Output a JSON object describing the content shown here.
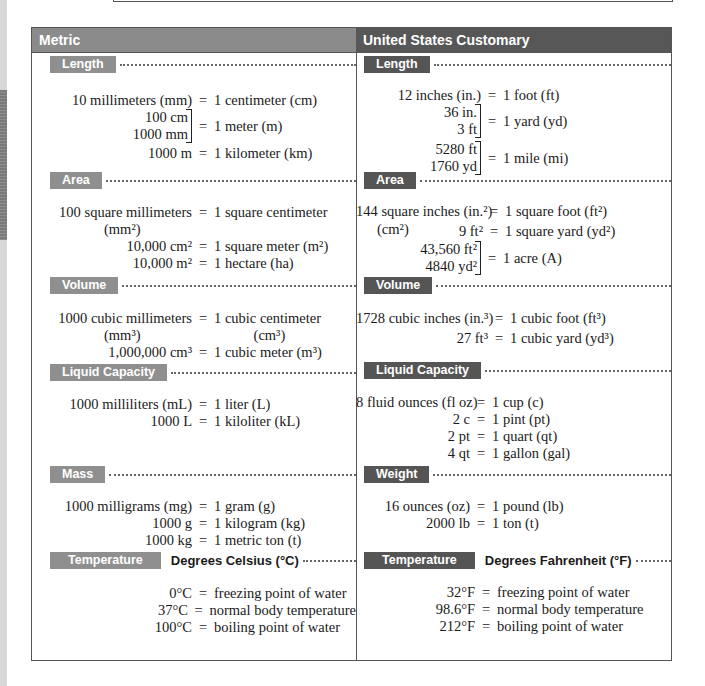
{
  "columns": {
    "metric": {
      "title": "Metric",
      "sections": {
        "length": {
          "label": "Length",
          "rows": [
            {
              "lhs": "10 millimeters (mm)",
              "rhs": "1 centimeter (cm)"
            },
            {
              "lhs_stack": [
                "100 cm",
                "1000 mm"
              ],
              "rhs": "1 meter (m)"
            },
            {
              "lhs": "1000 m",
              "rhs": "1 kilometer (km)"
            }
          ]
        },
        "area": {
          "label": "Area",
          "rows": [
            {
              "lhs": "100 square millimeters",
              "lhs_sub": "(mm²)",
              "rhs": "1 square centimeter",
              "rhs_sub": "(cm²)"
            },
            {
              "lhs": "10,000 cm²",
              "rhs": "1 square meter (m²)"
            },
            {
              "lhs": "10,000 m²",
              "rhs": "1 hectare (ha)"
            }
          ]
        },
        "volume": {
          "label": "Volume",
          "rows": [
            {
              "lhs": "1000 cubic millimeters",
              "lhs_sub": "(mm³)",
              "rhs": "1 cubic centimeter",
              "rhs_sub": "(cm³)"
            },
            {
              "lhs": "1,000,000 cm³",
              "rhs": "1 cubic meter (m³)"
            }
          ]
        },
        "liquid": {
          "label": "Liquid Capacity",
          "rows": [
            {
              "lhs": "1000 milliliters (mL)",
              "rhs": "1 liter (L)"
            },
            {
              "lhs": "1000 L",
              "rhs": "1 kiloliter (kL)"
            }
          ]
        },
        "mass": {
          "label": "Mass",
          "rows": [
            {
              "lhs": "1000 milligrams (mg)",
              "rhs": "1 gram (g)"
            },
            {
              "lhs": "1000 g",
              "rhs": "1 kilogram (kg)"
            },
            {
              "lhs": "1000 kg",
              "rhs": "1 metric ton (t)"
            }
          ]
        },
        "temperature": {
          "label": "Temperature",
          "subtitle": "Degrees Celsius (°C)",
          "rows": [
            {
              "lhs": "0°C",
              "rhs": "freezing point of water"
            },
            {
              "lhs": "37°C",
              "rhs": "normal body temperature"
            },
            {
              "lhs": "100°C",
              "rhs": "boiling point of water"
            }
          ]
        }
      }
    },
    "us": {
      "title": "United States Customary",
      "sections": {
        "length": {
          "label": "Length",
          "rows": [
            {
              "lhs": "12 inches (in.)",
              "rhs": "1 foot (ft)"
            },
            {
              "lhs_stack": [
                "36 in.",
                "3 ft"
              ],
              "rhs": "1 yard (yd)"
            },
            {
              "lhs_stack": [
                "5280 ft",
                "1760 yd"
              ],
              "rhs": "1 mile (mi)"
            }
          ]
        },
        "area": {
          "label": "Area",
          "rows": [
            {
              "lhs": "144 square inches (in.²)",
              "rhs": "1 square foot (ft²)"
            },
            {
              "lhs": "9 ft²",
              "rhs": "1 square yard (yd²)"
            },
            {
              "lhs_stack": [
                "43,560 ft²",
                "4840 yd²"
              ],
              "rhs": "1 acre (A)"
            }
          ]
        },
        "volume": {
          "label": "Volume",
          "rows": [
            {
              "lhs": "1728 cubic inches (in.³)",
              "rhs": "1 cubic foot (ft³)"
            },
            {
              "lhs": "27 ft³",
              "rhs": "1 cubic yard (yd³)"
            }
          ]
        },
        "liquid": {
          "label": "Liquid Capacity",
          "rows": [
            {
              "lhs": "8 fluid ounces (fl oz)",
              "rhs": "1 cup (c)"
            },
            {
              "lhs": "2 c",
              "rhs": "1 pint (pt)"
            },
            {
              "lhs": "2 pt",
              "rhs": "1 quart (qt)"
            },
            {
              "lhs": "4 qt",
              "rhs": "1 gallon (gal)"
            }
          ]
        },
        "weight": {
          "label": "Weight",
          "rows": [
            {
              "lhs": "16 ounces (oz)",
              "rhs": "1 pound (lb)"
            },
            {
              "lhs": "2000 lb",
              "rhs": "1 ton (t)"
            }
          ]
        },
        "temperature": {
          "label": "Temperature",
          "subtitle": "Degrees Fahrenheit (°F)",
          "rows": [
            {
              "lhs": "32°F",
              "rhs": "freezing point of water"
            },
            {
              "lhs": "98.6°F",
              "rhs": "normal body temperature"
            },
            {
              "lhs": "212°F",
              "rhs": "boiling point of water"
            }
          ]
        }
      }
    }
  },
  "equals": "=",
  "colors": {
    "metric_header": "#8b8b8b",
    "us_header": "#575757",
    "metric_tag": "#8f8f8f",
    "us_tag": "#555555",
    "border": "#555555"
  }
}
